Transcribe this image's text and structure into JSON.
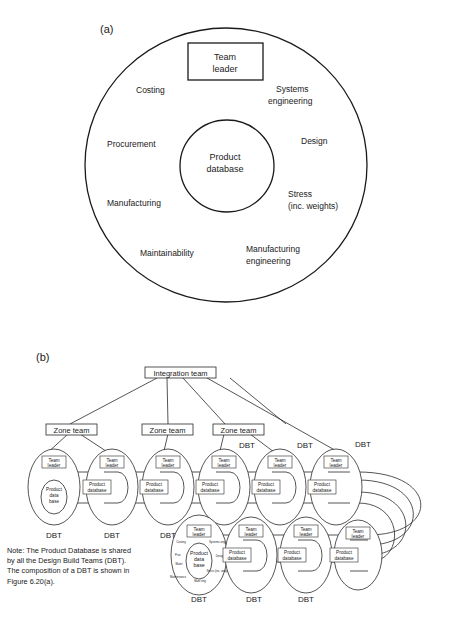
{
  "panel_a": {
    "label": "(a)",
    "team_leader": [
      "Team",
      "leader"
    ],
    "center": [
      "Product",
      "database"
    ],
    "functions": [
      {
        "lines": [
          "Costing"
        ]
      },
      {
        "lines": [
          "Systems",
          "engineering"
        ]
      },
      {
        "lines": [
          "Procurement"
        ]
      },
      {
        "lines": [
          "Design"
        ]
      },
      {
        "lines": [
          "Manufacturing"
        ]
      },
      {
        "lines": [
          "Stress",
          "(inc. weights)"
        ]
      },
      {
        "lines": [
          "Maintainability"
        ]
      },
      {
        "lines": [
          "Manufacturing",
          "engineering"
        ]
      }
    ]
  },
  "panel_b": {
    "label": "(b)",
    "integration_team": "Integration team",
    "zone_teams": [
      "Zone team",
      "Zone team",
      "Zone team"
    ],
    "dbt_label": "DBT",
    "team_leader": [
      "Team",
      "leader"
    ],
    "product_database": [
      "Product",
      "database"
    ],
    "first_dbt_center": [
      "Product",
      "data",
      "base"
    ],
    "detailed_dbt": {
      "center": [
        "Product",
        "data",
        "base"
      ],
      "labels": [
        "Costing",
        "Systems eng",
        "Proc",
        "Design",
        "Maint",
        "Stress (inc. weights)",
        "Maintenance",
        "Manf eng"
      ]
    },
    "dbt_count": 11
  },
  "note": {
    "lines": [
      "Note: The Product Database is shared",
      "by all the Design Build Teams (DBT).",
      "The composition of a DBT is shown in",
      "Figure 6.20(a)."
    ]
  }
}
